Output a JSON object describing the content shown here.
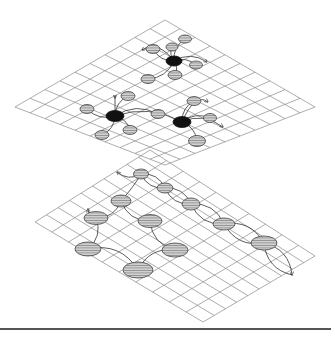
{
  "diagram": {
    "colors": {
      "grid": "#8a8a8a",
      "hub": "#111111",
      "hatch_fill": "#9a9a9a",
      "line": "#333333",
      "background": "#ffffff"
    },
    "top_plane": {
      "corners": {
        "top": [
          165,
          20
        ],
        "left": [
          15,
          107
        ],
        "right": [
          315,
          107
        ],
        "bottom": [
          165,
          165
        ]
      },
      "divisions": [
        10,
        10
      ],
      "hubs": [
        {
          "id": "hub-1",
          "cx": 174,
          "cy": 61,
          "rx": 8,
          "ry": 5
        },
        {
          "id": "hub-2",
          "cx": 115,
          "cy": 116,
          "rx": 9,
          "ry": 5.5
        },
        {
          "id": "hub-3",
          "cx": 182,
          "cy": 122,
          "rx": 9,
          "ry": 5.5
        }
      ],
      "satellites": [
        {
          "hub": "hub-1",
          "cx": 153,
          "cy": 49,
          "rx": 7,
          "ry": 4.5
        },
        {
          "hub": "hub-1",
          "cx": 172,
          "cy": 47,
          "rx": 6,
          "ry": 4
        },
        {
          "hub": "hub-1",
          "cx": 185,
          "cy": 39,
          "rx": 6.5,
          "ry": 4
        },
        {
          "hub": "hub-1",
          "cx": 196,
          "cy": 65,
          "rx": 6.5,
          "ry": 4
        },
        {
          "hub": "hub-1",
          "cx": 148,
          "cy": 79,
          "rx": 7,
          "ry": 4.5
        },
        {
          "hub": "hub-1",
          "cx": 175,
          "cy": 75,
          "rx": 7,
          "ry": 4.5
        },
        {
          "hub": "hub-2",
          "cx": 128,
          "cy": 96,
          "rx": 7,
          "ry": 4.5
        },
        {
          "hub": "hub-2",
          "cx": 87,
          "cy": 109,
          "rx": 7,
          "ry": 4.5
        },
        {
          "hub": "hub-2",
          "cx": 102,
          "cy": 135,
          "rx": 7,
          "ry": 4.5
        },
        {
          "hub": "hub-2",
          "cx": 130,
          "cy": 130,
          "rx": 7,
          "ry": 4.5
        },
        {
          "hub": "hub-2",
          "cx": 158,
          "cy": 114,
          "rx": 7,
          "ry": 4.5
        },
        {
          "hub": "hub-3",
          "cx": 194,
          "cy": 101,
          "rx": 7,
          "ry": 4.5
        },
        {
          "hub": "hub-3",
          "cx": 210,
          "cy": 118,
          "rx": 6.5,
          "ry": 4.5
        },
        {
          "hub": "hub-3",
          "cx": 197,
          "cy": 141,
          "rx": 8.5,
          "ry": 5.5
        }
      ],
      "arrows": [
        {
          "from": "hub-1",
          "tip": [
            142,
            50
          ]
        },
        {
          "from": "hub-1",
          "tip": [
            207,
            62
          ]
        },
        {
          "from": "hub-2",
          "tip": [
            115,
            98
          ]
        },
        {
          "from": "hub-3",
          "tip": [
            208,
            102
          ]
        },
        {
          "from": "hub-3",
          "tip": [
            223,
            127
          ]
        }
      ]
    },
    "bottom_plane": {
      "corners": {
        "top": [
          150,
          150
        ],
        "left": [
          35,
          222
        ],
        "right": [
          315,
          256
        ],
        "bottom": [
          203,
          322
        ]
      },
      "divisions": [
        10,
        10
      ],
      "chain_nodes": [
        {
          "cx": 141,
          "cy": 174,
          "rx": 7.5,
          "ry": 5
        },
        {
          "cx": 165,
          "cy": 188,
          "rx": 8,
          "ry": 5
        },
        {
          "cx": 121,
          "cy": 201,
          "rx": 10,
          "ry": 6
        },
        {
          "cx": 191,
          "cy": 204,
          "rx": 9,
          "ry": 6
        },
        {
          "cx": 96,
          "cy": 218,
          "rx": 12,
          "ry": 6.5
        },
        {
          "cx": 150,
          "cy": 221,
          "rx": 12,
          "ry": 6.5
        },
        {
          "cx": 224,
          "cy": 224,
          "rx": 11,
          "ry": 6
        },
        {
          "cx": 264,
          "cy": 243,
          "rx": 13,
          "ry": 7
        },
        {
          "cx": 88,
          "cy": 249,
          "rx": 13,
          "ry": 7
        },
        {
          "cx": 175,
          "cy": 250,
          "rx": 13,
          "ry": 7
        },
        {
          "cx": 138,
          "cy": 270,
          "rx": 15,
          "ry": 8
        }
      ],
      "arrows": [
        {
          "tip": [
            117,
            172
          ]
        },
        {
          "tip": [
            88,
            209
          ]
        },
        {
          "tip": [
            292,
            275
          ]
        }
      ]
    },
    "footer_rule": {
      "y": 329,
      "x1": 0,
      "x2": 331
    }
  }
}
